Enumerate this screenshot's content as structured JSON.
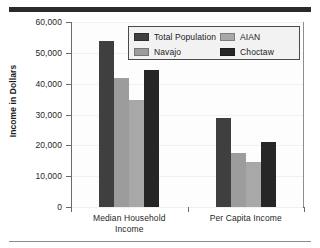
{
  "chart_data": {
    "type": "bar",
    "title": "",
    "xlabel": "",
    "ylabel": "Income in Dollars",
    "ylim": [
      0,
      60000
    ],
    "ytick_values": [
      0,
      10000,
      20000,
      30000,
      40000,
      50000,
      60000
    ],
    "ytick_labels": [
      "0",
      "10,000",
      "20,000",
      "30,000",
      "40,000",
      "50,000",
      "60,000"
    ],
    "grid": false,
    "legend_position": "upper right (inside plot area)",
    "categories": [
      "Median Household Income",
      "Per Capita Income"
    ],
    "category_label_lines": [
      [
        "Median Household",
        "Income"
      ],
      [
        "Per Capita Income"
      ]
    ],
    "series": [
      {
        "name": "Total Population",
        "color": "#3f3f3f",
        "values": [
          54000,
          28900
        ]
      },
      {
        "name": "Navajo",
        "color": "#9c9c9c",
        "values": [
          41800,
          17500
        ]
      },
      {
        "name": "AIAN",
        "color": "#a8a8a8",
        "values": [
          34700,
          14600
        ]
      },
      {
        "name": "Choctaw",
        "color": "#262626",
        "values": [
          44400,
          21000
        ]
      }
    ]
  },
  "legend": {
    "entries": [
      {
        "label": "Total Population",
        "color": "#3f3f3f"
      },
      {
        "label": "AIAN",
        "color": "#a8a8a8"
      },
      {
        "label": "Navajo",
        "color": "#9c9c9c"
      },
      {
        "label": "Choctaw",
        "color": "#262626"
      }
    ]
  },
  "axes": {
    "y_title": "Income in Dollars",
    "y_ticks": [
      "60,000",
      "50,000",
      "40,000",
      "30,000",
      "20,000",
      "10,000",
      "0"
    ],
    "x_groups": [
      {
        "line1": "Median Household",
        "line2": "Income"
      },
      {
        "line1": "Per Capita Income",
        "line2": ""
      }
    ]
  }
}
